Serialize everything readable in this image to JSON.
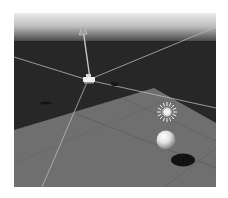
{
  "scene_view": {
    "type": "3d-scene-viewport",
    "colors": {
      "sky_top": "#e6e6e6",
      "sky_bottom": "#8c8c8c",
      "ground_dark": "#262626",
      "plane": "#6e6e6e",
      "gizmo_lines": "#bdbdbd",
      "sphere_highlight": "#f5f5f5",
      "sphere_shadow": "#141414"
    },
    "objects": [
      {
        "name": "camera",
        "icon": "camera-icon"
      },
      {
        "name": "up-axis-arrow",
        "icon": "arrow-up-icon"
      },
      {
        "name": "directional-light",
        "icon": "sun-icon"
      },
      {
        "name": "sphere",
        "icon": "sphere-icon"
      },
      {
        "name": "plane",
        "icon": "plane-icon"
      }
    ]
  }
}
